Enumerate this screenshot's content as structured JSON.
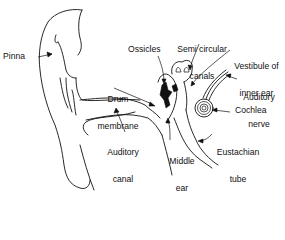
{
  "diagram": {
    "labels": {
      "pinna": "Pinna",
      "ossicles": "Ossicles",
      "semicircular_canals_1": "Semi circular",
      "semicircular_canals_2": "canals",
      "vestibule_1": "Vestibule of",
      "vestibule_2": "inner ear",
      "drum_membrane_1": "Drum",
      "drum_membrane_2": "membrane",
      "auditory_nerve_1": "Auditory",
      "auditory_nerve_2": "nerve",
      "cochlea": "Cochlea",
      "auditory_canal_1": "Auditory",
      "auditory_canal_2": "canal",
      "middle_ear_1": "Middle",
      "middle_ear_2": "ear",
      "eustachian_tube_1": "Eustachian",
      "eustachian_tube_2": "tube"
    },
    "colors": {
      "ink": "#111111",
      "background": "#ffffff"
    }
  }
}
